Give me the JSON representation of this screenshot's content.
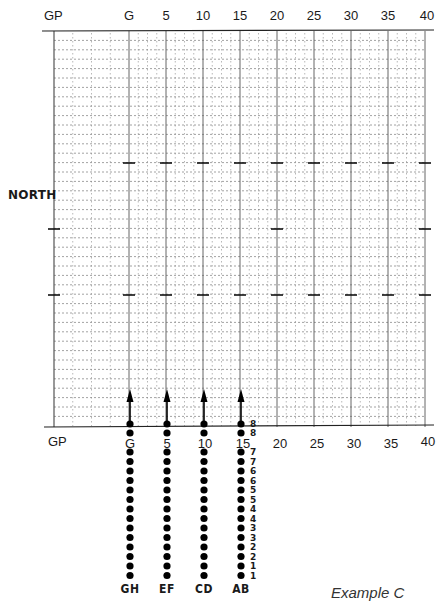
{
  "title": "Example C",
  "side_label": "NORTH",
  "top_axis": {
    "labels": [
      "GP",
      "G",
      "5",
      "10",
      "15",
      "20",
      "25",
      "30",
      "35",
      "40"
    ]
  },
  "bottom_axis": {
    "labels": [
      "GP",
      "G",
      "5",
      "10",
      "15",
      "20",
      "25",
      "30",
      "35",
      "40"
    ]
  },
  "grid": {
    "left": 54,
    "right": 426,
    "top": 31,
    "bottom": 427,
    "major_x": [
      54,
      129,
      166,
      203,
      240,
      277,
      314,
      351,
      388,
      425
    ],
    "minor_subdivisions": 4,
    "row_spacing": 9.4,
    "line_color": "#555555",
    "tick_rows": [
      {
        "y": 163,
        "at": [
          "G",
          "5",
          "10",
          "15",
          "20",
          "25",
          "30",
          "35",
          "40"
        ]
      },
      {
        "y": 229,
        "at": [
          "GP",
          "20",
          "40"
        ]
      },
      {
        "y": 295,
        "at": [
          "GP",
          "G",
          "5",
          "10",
          "15",
          "20",
          "25",
          "30",
          "35",
          "40"
        ]
      }
    ]
  },
  "columns": [
    {
      "label": "GH",
      "axis_value": "G"
    },
    {
      "label": "EF",
      "axis_value": "5"
    },
    {
      "label": "CD",
      "axis_value": "10"
    },
    {
      "label": "AB",
      "axis_value": "15"
    }
  ],
  "dots_per_column": 16,
  "dot_numbers": [
    "8",
    "8",
    "7",
    "7",
    "6",
    "6",
    "5",
    "5",
    "4",
    "4",
    "3",
    "3",
    "2",
    "2",
    "1",
    "1"
  ],
  "arrows": {
    "count": 4,
    "direction": "up"
  }
}
